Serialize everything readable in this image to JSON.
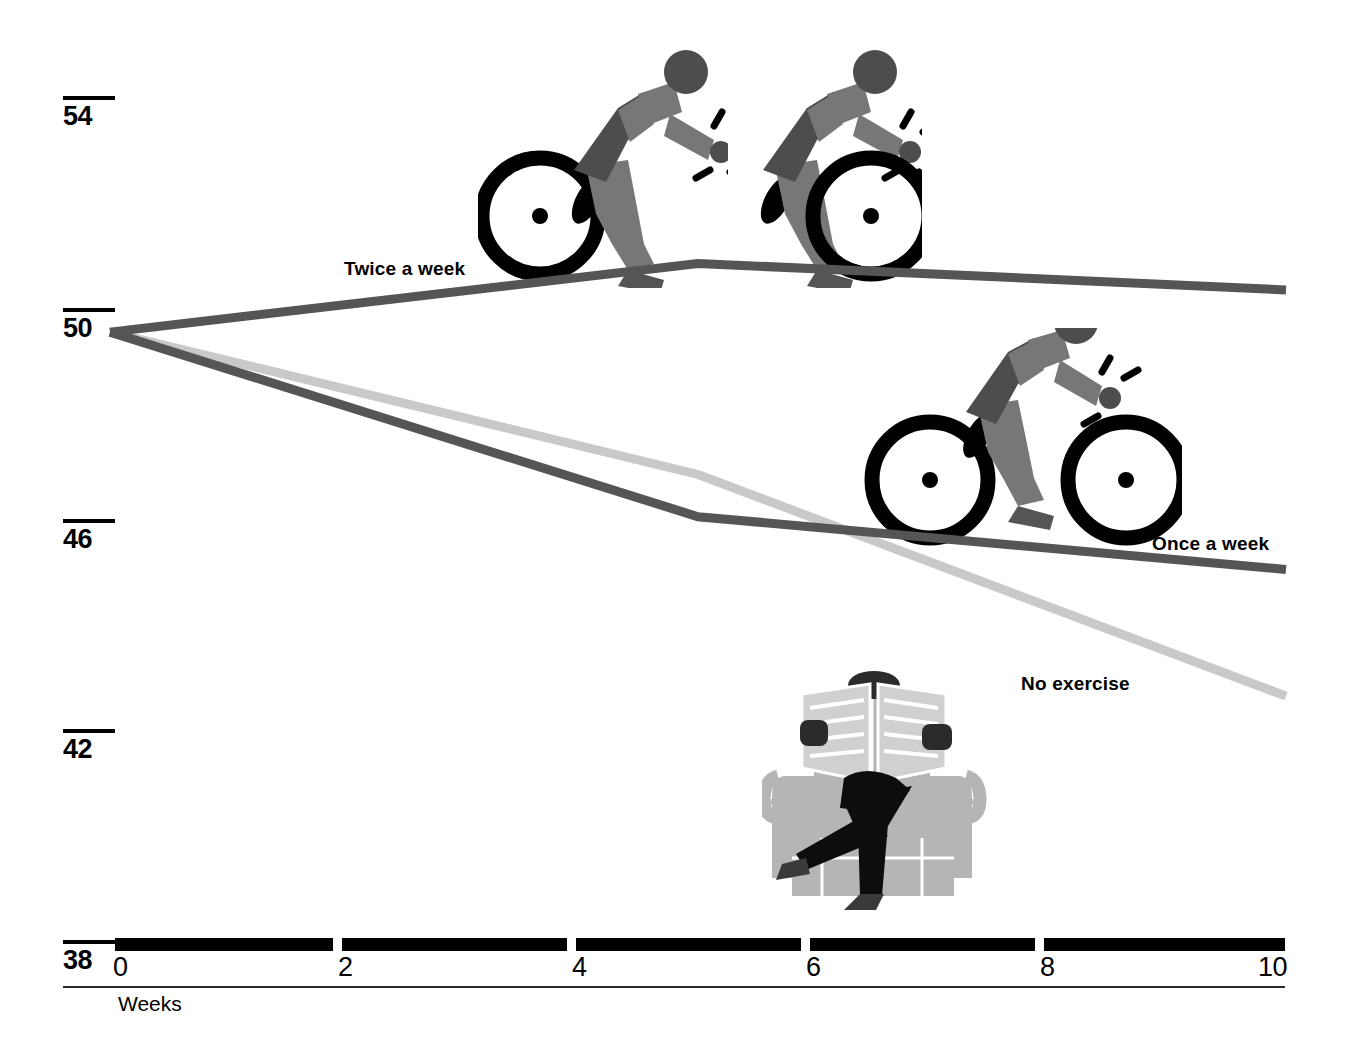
{
  "chart_data": {
    "type": "line",
    "title": "",
    "subtitle": "",
    "xlabel": "Weeks",
    "ylabel": "",
    "xlim": [
      0,
      10
    ],
    "ylim": [
      38,
      54
    ],
    "xticks": [
      "0",
      "2",
      "4",
      "6",
      "8",
      "10"
    ],
    "yticks": [
      "54",
      "50",
      "46",
      "42",
      "38"
    ],
    "grid": false,
    "legend_position": "inline-annotations",
    "x": [
      0,
      5,
      10
    ],
    "series": [
      {
        "name": "Twice a week",
        "color": "#555555",
        "values": [
          49.6,
          50.9,
          50.4
        ]
      },
      {
        "name": "Once a week",
        "color": "#555555",
        "values": [
          49.6,
          46.1,
          45.1
        ]
      },
      {
        "name": "No exercise",
        "color": "#c9c9c9",
        "values": [
          49.6,
          46.9,
          42.7
        ]
      }
    ]
  },
  "axes": {
    "y_ticks": [
      {
        "label": "54",
        "top": 96
      },
      {
        "label": "50",
        "top": 308
      },
      {
        "label": "46",
        "top": 519
      },
      {
        "label": "42",
        "top": 729
      },
      {
        "label": "38",
        "top": 940
      }
    ],
    "x_ticks": [
      {
        "label": "0",
        "left": 113
      },
      {
        "label": "2",
        "left": 338
      },
      {
        "label": "4",
        "left": 572
      },
      {
        "label": "6",
        "left": 806
      },
      {
        "label": "8",
        "left": 1040
      },
      {
        "label": "10",
        "left": 1258
      }
    ],
    "x_caption": "Weeks"
  },
  "annotations": [
    {
      "name": "twice-a-week",
      "text": "Twice a week",
      "left": 344,
      "top": 258
    },
    {
      "name": "once-a-week",
      "text": "Once a week",
      "left": 1152,
      "top": 533
    },
    {
      "name": "no-exercise",
      "text": "No exercise",
      "left": 1021,
      "top": 673
    }
  ],
  "pictograms": [
    {
      "name": "cyclist-pictogram-1",
      "label": "cyclist"
    },
    {
      "name": "cyclist-pictogram-2",
      "label": "cyclist"
    },
    {
      "name": "cyclist-pictogram-3",
      "label": "cyclist"
    },
    {
      "name": "armchair-reader-pictogram",
      "label": "person reading newspaper in armchair"
    }
  ],
  "colors": {
    "line_dark": "#555555",
    "line_light": "#c9c9c9",
    "figure_dark": "#4d4d4d",
    "figure_mid": "#777777",
    "chair_light": "#b5b5b5",
    "ink": "#000000"
  }
}
